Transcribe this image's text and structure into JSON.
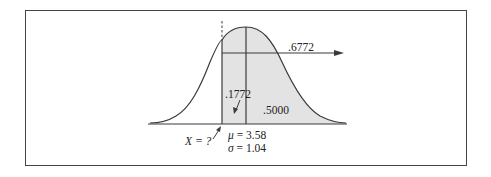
{
  "diagram": {
    "type": "normal-distribution",
    "labels": {
      "upper_area": ".6772",
      "middle_area": ".1772",
      "right_area": ".5000",
      "unknown_x": "X = ?",
      "mu_symbol": "μ",
      "mu_text": " = 3.58",
      "sigma_symbol": "σ",
      "sigma_text": " = 1.04"
    },
    "parameters": {
      "mean": 3.58,
      "std_dev": 1.04
    },
    "areas": {
      "total_shaded": 0.6772,
      "between_x_and_mean": 0.1772,
      "above_mean": 0.5
    },
    "colors": {
      "shade": "#e3e3e3",
      "line": "#3a3a3a",
      "frame": "#444444"
    }
  }
}
